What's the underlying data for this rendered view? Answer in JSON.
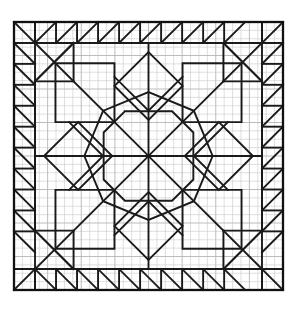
{
  "diagram": {
    "medium": "graph paper line drawing",
    "canvas": {
      "width": 297,
      "height": 310,
      "background": "#ffffff"
    },
    "colors": {
      "grid_line": "#c9c9c9",
      "grid_line_major": "#b3b3b3",
      "pattern_line": "#1a1a1a",
      "frame_line": "#111111",
      "fill": "#ffffff"
    },
    "grid": {
      "visible": true,
      "cell_size": 8.4,
      "columns": 32,
      "rows": 32,
      "major_every": 4,
      "origin_x": 14,
      "origin_y": 22
    },
    "frame": {
      "x": 14,
      "y": 22,
      "width": 269,
      "height": 268,
      "stroke_width": 2.2,
      "label": "outer-border"
    },
    "border_band": {
      "label": "sawtooth triangle border",
      "thickness_cells": 2.5,
      "unit_width_cells": 2.5,
      "triangles_per_side": 10,
      "description": "half-square triangles pointing inward around all four sides"
    },
    "center": {
      "x": 148,
      "y": 156
    },
    "motif": {
      "name": "eight-pointed LeMoyne star medallion",
      "symmetry": "4-fold rotational / mirrored",
      "components": [
        "central eight-point star",
        "diamond kites",
        "corner squares on point",
        "surrounding octagon ring",
        "sawtooth outer border"
      ]
    },
    "chart_data": {
      "type": "table",
      "title": "Quilt Block Pattern Diagram",
      "categories": [
        "border triangles",
        "star points",
        "corner blocks",
        "grid cells"
      ],
      "values": [
        40,
        8,
        4,
        1024
      ],
      "xlabel": "element",
      "ylabel": "count"
    }
  }
}
